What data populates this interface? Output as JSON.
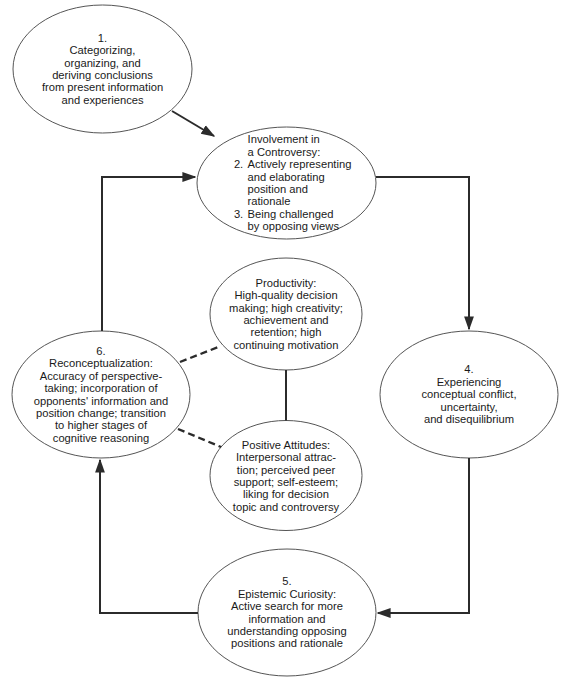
{
  "diagram": {
    "colors": {
      "stroke": "#2b2b2b",
      "ellipse_stroke": "#555555",
      "background": "#ffffff",
      "text": "#1a1a1a"
    },
    "nodes": {
      "n1": {
        "text": "1.\nCategorizing,\norganizing, and\nderiving conclusions\nfrom present information\nand experiences"
      },
      "n23": {
        "title": "Involvement in\na Controversy:",
        "item2_num": "2.",
        "item2_text": "Actively representing\nand elaborating\nposition and\nrationale",
        "item3_num": "3.",
        "item3_text": "Being challenged\nby opposing views"
      },
      "n4": {
        "text": "4.\nExperiencing\nconceptual conflict,\nuncertainty,\nand disequilibrium"
      },
      "n5": {
        "text": "5.\nEpistemic Curiosity:\nActive search for more\ninformation and\nunderstanding opposing\npositions and rationale"
      },
      "n6": {
        "text": "6.\nReconceptualization:\nAccuracy of perspective-\ntaking; incorporation of\nopponents' information and\nposition change; transition\nto higher stages of\ncognitive reasoning"
      },
      "productivity": {
        "text": "Productivity:\nHigh-quality decision\nmaking; high creativity;\nachievement and\nretention; high\ncontinuing motivation"
      },
      "attitudes": {
        "text": "Positive Attitudes:\nInterpersonal attrac-\ntion; perceived peer\nsupport; self-esteem;\nliking for decision\ntopic and controversy"
      }
    },
    "edges": [
      {
        "from": "n1",
        "to": "n23",
        "style": "solid-arrow"
      },
      {
        "from": "n23",
        "to": "n4",
        "style": "solid-arrow"
      },
      {
        "from": "n4",
        "to": "n5",
        "style": "solid-arrow"
      },
      {
        "from": "n5",
        "to": "n6",
        "style": "solid-arrow"
      },
      {
        "from": "n6",
        "to": "n23",
        "style": "solid-arrow"
      },
      {
        "from": "productivity",
        "to": "attitudes",
        "style": "solid-line"
      },
      {
        "from": "n6",
        "to": "productivity",
        "style": "dashed-line"
      },
      {
        "from": "n6",
        "to": "attitudes",
        "style": "dashed-line"
      }
    ]
  }
}
